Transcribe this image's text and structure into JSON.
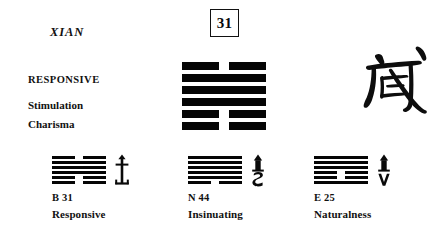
{
  "hexagram": {
    "number": "31",
    "pinyin_name": "XIAN",
    "chinese_character": "咸",
    "keyword_main": "RESPONSIVE",
    "keyword_sub_1": "Stimulation",
    "keyword_sub_2": "Charisma",
    "lines_top_to_bottom": [
      "broken",
      "solid",
      "solid",
      "solid",
      "broken",
      "broken"
    ]
  },
  "related": [
    {
      "code": "B 31",
      "name": "Responsive",
      "glyph": "anchor-icon",
      "lines_top_to_bottom": [
        "broken",
        "solid",
        "solid",
        "solid",
        "broken",
        "broken"
      ]
    },
    {
      "code": "N 44",
      "name": "Insinuating",
      "glyph": "arrow-up-over-s-icon",
      "lines_top_to_bottom": [
        "solid",
        "solid",
        "solid",
        "solid",
        "solid",
        "broken"
      ]
    },
    {
      "code": "E 25",
      "name": "Naturalness",
      "glyph": "arrow-up-over-v-icon",
      "lines_top_to_bottom": [
        "solid",
        "solid",
        "solid",
        "broken",
        "broken",
        "solid"
      ]
    }
  ],
  "colors": {
    "ink": "#0a0a0a",
    "background": "#ffffff"
  }
}
